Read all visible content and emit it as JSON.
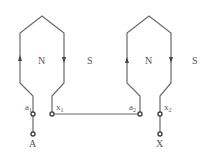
{
  "diagram": {
    "type": "two-pole winding connection",
    "coils": [
      {
        "name": "coil-1",
        "pole_labels": {
          "left": "N",
          "right": "S"
        },
        "start_terminal": {
          "label": "a",
          "sub": "1"
        },
        "end_terminal": {
          "label": "x",
          "sub": "1"
        },
        "current_direction": {
          "left_side": "up",
          "right_side": "down"
        }
      },
      {
        "name": "coil-2",
        "pole_labels": {
          "left": "N",
          "right": "S"
        },
        "start_terminal": {
          "label": "a",
          "sub": "2"
        },
        "end_terminal": {
          "label": "x",
          "sub": "2"
        },
        "current_direction": {
          "left_side": "up",
          "right_side": "down"
        }
      }
    ],
    "connection": "x1 connected to a2",
    "external_terminals": {
      "start": "A",
      "end": "X"
    },
    "colors": {
      "line": "#6a6a6a",
      "text": "#555555",
      "background": "#ffffff"
    }
  }
}
